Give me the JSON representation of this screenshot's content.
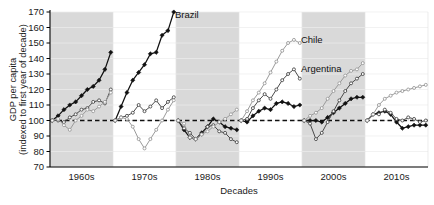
{
  "chart_data": {
    "type": "line",
    "title": "",
    "xlabel": "Decades",
    "ylabel": "GDP per capita\n(indexed to first year of decade)",
    "ylabel_line1": "GDP per capita",
    "ylabel_line2": "(indexed to first year of decade)",
    "ylim": [
      70,
      170
    ],
    "yticks": [
      70,
      80,
      90,
      100,
      110,
      120,
      130,
      140,
      150,
      160,
      170
    ],
    "ytick_labels": [
      "70",
      "80",
      "90",
      "100",
      "110",
      "120",
      "130",
      "140",
      "150",
      "160",
      "170"
    ],
    "categories": [
      "1960s",
      "1970s",
      "1980s",
      "1990s",
      "2000s",
      "2010s"
    ],
    "xtick_labels": [
      "1960s",
      "1970s",
      "1980s",
      "1990s",
      "2000s",
      "2010s"
    ],
    "grid": true,
    "legend": "inline-annotations",
    "reference_line": 100,
    "shaded_decades": [
      "1960s",
      "1980s",
      "2000s"
    ],
    "annotations": [
      {
        "text": "Brazil",
        "decade": "1970s",
        "value": 168,
        "color": "#111111"
      },
      {
        "text": "Chile",
        "decade": "1990s",
        "value": 152,
        "color": "#8a8a8a"
      },
      {
        "text": "Argentina",
        "decade": "1990s",
        "value": 133,
        "color": "#4a4a4a"
      }
    ],
    "series": [
      {
        "name": "Brazil",
        "color": "#111111",
        "marker": "filled-diamond",
        "decade_values": {
          "1960s": [
            100,
            103,
            107,
            110,
            112,
            116,
            120,
            122,
            126,
            133,
            144
          ],
          "1970s": [
            100,
            109,
            118,
            126,
            131,
            136,
            143,
            144,
            155,
            158,
            170
          ],
          "1980s": [
            100,
            94,
            89,
            88,
            92,
            96,
            101,
            99,
            96,
            95,
            94
          ],
          "1990s": [
            100,
            99,
            103,
            106,
            108,
            107,
            111,
            112,
            111,
            109,
            110
          ],
          "2000s": [
            100,
            100,
            100,
            99,
            102,
            105,
            108,
            111,
            114,
            115,
            115
          ],
          "2010s": [
            100,
            104,
            105,
            106,
            104,
            99,
            95,
            96,
            97,
            97,
            97
          ]
        }
      },
      {
        "name": "Argentina",
        "color": "#4a4a4a",
        "marker": "open-circle",
        "decade_values": {
          "1960s": [
            100,
            100,
            99,
            102,
            104,
            107,
            108,
            112,
            113,
            111,
            120
          ],
          "1970s": [
            100,
            102,
            103,
            105,
            110,
            106,
            109,
            113,
            108,
            112,
            115
          ],
          "1980s": [
            100,
            95,
            92,
            88,
            91,
            96,
            97,
            93,
            92,
            88,
            86
          ],
          "1990s": [
            100,
            101,
            108,
            113,
            117,
            114,
            120,
            126,
            130,
            133,
            127
          ],
          "2000s": [
            100,
            98,
            88,
            92,
            99,
            106,
            113,
            119,
            124,
            127,
            130
          ],
          "2010s": [
            100,
            104,
            104,
            107,
            105,
            101,
            100,
            102,
            101,
            99,
            100
          ]
        }
      },
      {
        "name": "Chile",
        "color": "#9a9a9a",
        "marker": "open-circle",
        "decade_values": {
          "1960s": [
            100,
            101,
            97,
            94,
            100,
            103,
            107,
            106,
            109,
            112,
            118
          ],
          "1970s": [
            100,
            102,
            101,
            96,
            88,
            82,
            88,
            94,
            100,
            107,
            113
          ],
          "1980s": [
            100,
            98,
            89,
            88,
            91,
            93,
            96,
            99,
            101,
            104,
            107
          ],
          "1990s": [
            100,
            106,
            113,
            118,
            124,
            131,
            138,
            145,
            150,
            152,
            150
          ],
          "2000s": [
            100,
            103,
            105,
            108,
            114,
            119,
            124,
            129,
            132,
            133,
            137
          ],
          "2010s": [
            100,
            104,
            110,
            114,
            116,
            118,
            119,
            120,
            121,
            122,
            123
          ]
        }
      }
    ]
  }
}
